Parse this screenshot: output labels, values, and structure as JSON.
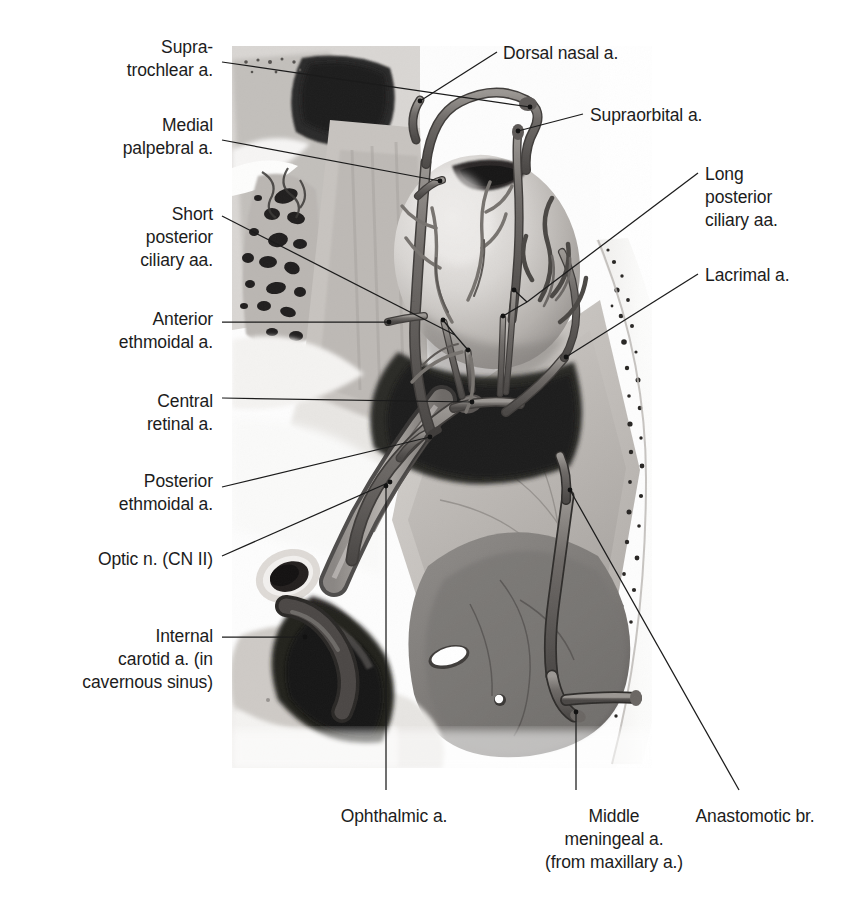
{
  "figure": {
    "type": "anatomical-illustration",
    "style": "grayscale halftone medical illustration with leader-line labels",
    "background_color": "#ffffff",
    "leader_color": "#1b1b1b",
    "text_color": "#1c1c1c"
  },
  "labels_left": [
    {
      "id": "supratrochlear",
      "lines": [
        "Supra-",
        "trochlear a."
      ],
      "x": 213,
      "y": 36,
      "align": "right"
    },
    {
      "id": "medial-palpebral",
      "lines": [
        "Medial",
        "palpebral a."
      ],
      "x": 213,
      "y": 114,
      "align": "right"
    },
    {
      "id": "short-post-ciliary",
      "lines": [
        "Short",
        "posterior",
        "ciliary aa."
      ],
      "x": 213,
      "y": 203,
      "align": "right"
    },
    {
      "id": "anterior-ethmoidal",
      "lines": [
        "Anterior",
        "ethmoidal a."
      ],
      "x": 213,
      "y": 308,
      "align": "right"
    },
    {
      "id": "central-retinal",
      "lines": [
        "Central",
        "retinal a."
      ],
      "x": 213,
      "y": 390,
      "align": "right"
    },
    {
      "id": "posterior-ethmoidal",
      "lines": [
        "Posterior",
        "ethmoidal a."
      ],
      "x": 213,
      "y": 470,
      "align": "right"
    },
    {
      "id": "optic-nerve",
      "lines": [
        "Optic n. (CN II)"
      ],
      "x": 213,
      "y": 548,
      "align": "right"
    },
    {
      "id": "internal-carotid",
      "lines": [
        "Internal",
        "carotid a. (in",
        "cavernous sinus)"
      ],
      "x": 213,
      "y": 625,
      "align": "right"
    }
  ],
  "labels_right": [
    {
      "id": "dorsal-nasal",
      "lines": [
        "Dorsal nasal a."
      ],
      "x": 503,
      "y": 42,
      "align": "left"
    },
    {
      "id": "supraorbital",
      "lines": [
        "Supraorbital a."
      ],
      "x": 590,
      "y": 104,
      "align": "left"
    },
    {
      "id": "long-post-ciliary",
      "lines": [
        "Long",
        "posterior",
        "ciliary aa."
      ],
      "x": 705,
      "y": 163,
      "align": "left"
    },
    {
      "id": "lacrimal",
      "lines": [
        "Lacrimal a."
      ],
      "x": 705,
      "y": 264,
      "align": "left"
    }
  ],
  "labels_bottom": [
    {
      "id": "ophthalmic",
      "lines": [
        "Ophthalmic a."
      ],
      "x": 394,
      "y": 805,
      "align": "center"
    },
    {
      "id": "middle-meningeal",
      "lines": [
        "Middle",
        "meningeal a.",
        "(from maxillary a.)"
      ],
      "x": 614,
      "y": 805,
      "align": "center"
    },
    {
      "id": "anastomotic",
      "lines": [
        "Anastomotic br."
      ],
      "x": 755,
      "y": 805,
      "align": "center"
    }
  ],
  "leaders": [
    {
      "id": "supratrochlear",
      "path": "M 222 62 L 530 107",
      "dot": [
        530,
        107
      ]
    },
    {
      "id": "medial-palpebral",
      "path": "M 222 140 L 440 181",
      "dot": [
        440,
        181
      ]
    },
    {
      "id": "short-post-ciliary",
      "path": "M 222 216 L 455 335 M 443 320 L 455 335 M 455 335 L 468 350",
      "dots": [
        [
          443,
          320
        ],
        [
          468,
          350
        ]
      ]
    },
    {
      "id": "anterior-ethmoidal",
      "path": "M 222 322 L 389 322",
      "dot": [
        389,
        322
      ]
    },
    {
      "id": "central-retinal",
      "path": "M 222 398 L 472 402",
      "dot": [
        472,
        402
      ]
    },
    {
      "id": "posterior-ethmoidal",
      "path": "M 222 487 L 430 437",
      "dot": [
        430,
        437
      ]
    },
    {
      "id": "optic-nerve",
      "path": "M 222 556 L 390 482",
      "dot": [
        390,
        482
      ]
    },
    {
      "id": "internal-carotid",
      "path": "M 222 637 L 305 637",
      "dot": [
        305,
        637
      ]
    },
    {
      "id": "dorsal-nasal",
      "path": "M 497 52 L 420 101",
      "dot": [
        420,
        101
      ]
    },
    {
      "id": "supraorbital",
      "path": "M 583 114 L 518 131",
      "dot": [
        518,
        131
      ]
    },
    {
      "id": "long-post-ciliary",
      "path": "M 698 173 L 527 302 M 514 290 L 527 302 M 527 302 L 503 316",
      "dots": [
        [
          514,
          290
        ],
        [
          503,
          316
        ]
      ]
    },
    {
      "id": "lacrimal",
      "path": "M 698 274 L 566 357",
      "dot": [
        566,
        357
      ]
    },
    {
      "id": "ophthalmic",
      "path": "M 386 790 L 386 486",
      "dot": [
        386,
        486
      ]
    },
    {
      "id": "middle-meningeal",
      "path": "M 576 790 L 576 712",
      "dot": [
        576,
        712
      ]
    },
    {
      "id": "anastomotic",
      "path": "M 739 790 L 570 490",
      "dot": [
        570,
        490
      ]
    }
  ]
}
